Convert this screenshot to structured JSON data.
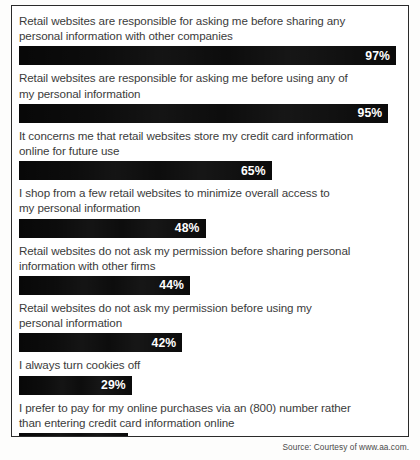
{
  "source_note": "Source: Courtesy of www.aa.com.",
  "chart_data": {
    "type": "bar",
    "title": "",
    "xlabel": "",
    "ylabel": "",
    "xlim": [
      0,
      100
    ],
    "grid": false,
    "legend": false,
    "orientation": "horizontal",
    "value_suffix": "%",
    "bar_color": "#080808",
    "value_label_color": "#ffffff",
    "categories": [
      "Retail websites are responsible for asking me before sharing any personal information with other companies",
      "Retail websites are responsible for asking me before using any of my personal information",
      "It concerns me that retail websites store my credit card information online for future use",
      "I shop from a few retail websites to minimize overall access to my personal information",
      "Retail websites do not ask my permission before sharing personal information with other firms",
      "Retail websites do not ask my permission before using my personal information",
      "I always turn cookies off",
      "I prefer to pay for my online purchases via an (800) number rather than entering credit card information online"
    ],
    "values": [
      97,
      95,
      65,
      48,
      44,
      42,
      29,
      28
    ],
    "value_labels": [
      "97%",
      "95%",
      "65%",
      "48%",
      "44%",
      "42%",
      "29%",
      "28%"
    ],
    "rows": [
      {
        "label": "Retail websites are responsible for asking me before sharing any\npersonal information with other companies",
        "value": 97,
        "value_label": "97%"
      },
      {
        "label": "Retail websites are responsible for asking me before using any of\nmy personal information",
        "value": 95,
        "value_label": "95%"
      },
      {
        "label": "It concerns me that retail websites store my credit card information\nonline for future use",
        "value": 65,
        "value_label": "65%"
      },
      {
        "label": "I shop from a few retail websites to minimize overall access to\nmy personal information",
        "value": 48,
        "value_label": "48%"
      },
      {
        "label": "Retail websites do not ask my permission before sharing personal\ninformation with other firms",
        "value": 44,
        "value_label": "44%"
      },
      {
        "label": "Retail websites do not ask my permission before using my\npersonal information",
        "value": 42,
        "value_label": "42%"
      },
      {
        "label": "I always turn cookies off",
        "value": 29,
        "value_label": "29%"
      },
      {
        "label": "I prefer to pay for my online purchases via an (800) number rather\nthan entering credit card information online",
        "value": 28,
        "value_label": "28%"
      }
    ]
  }
}
